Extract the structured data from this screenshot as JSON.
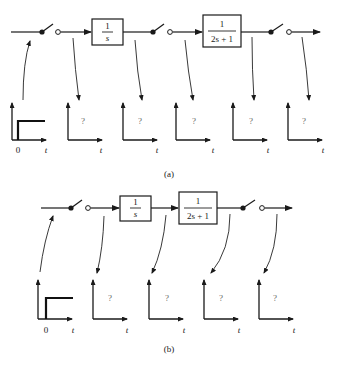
{
  "figure": {
    "panel_a": {
      "caption": "(a)",
      "blocks": [
        {
          "numerator": "1",
          "denominator": "s"
        },
        {
          "numerator": "1",
          "denominator": "2s + 1"
        }
      ],
      "switches": 3,
      "plots": [
        {
          "type": "step-input",
          "origin_label": "0",
          "axis_label": "t"
        },
        {
          "type": "unknown",
          "mark": "?",
          "axis_label": "t"
        },
        {
          "type": "unknown",
          "mark": "?",
          "axis_label": "t"
        },
        {
          "type": "unknown",
          "mark": "?",
          "axis_label": "t"
        },
        {
          "type": "unknown",
          "mark": "?",
          "axis_label": "t"
        },
        {
          "type": "unknown",
          "mark": "?",
          "axis_label": "t"
        }
      ]
    },
    "panel_b": {
      "caption": "(b)",
      "blocks": [
        {
          "numerator": "1",
          "denominator": "s"
        },
        {
          "numerator": "1",
          "denominator": "2s + 1"
        }
      ],
      "switches": 2,
      "plots": [
        {
          "type": "step-input",
          "origin_label": "0",
          "axis_label": "t"
        },
        {
          "type": "unknown",
          "mark": "?",
          "axis_label": "t"
        },
        {
          "type": "unknown",
          "mark": "?",
          "axis_label": "t"
        },
        {
          "type": "unknown",
          "mark": "?",
          "axis_label": "t"
        },
        {
          "type": "unknown",
          "mark": "?",
          "axis_label": "t"
        }
      ]
    }
  }
}
